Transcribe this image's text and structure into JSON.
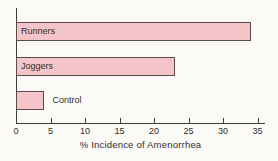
{
  "colors": {
    "background": "#fbfaf6",
    "bar_fill": "#f5c4c8",
    "bar_border": "#584c4d",
    "axis": "#3d3d3d",
    "text": "#2f2f2f"
  },
  "chart_data": {
    "type": "bar",
    "orientation": "horizontal",
    "title": "",
    "categories": [
      "Runners",
      "Joggers",
      "Control"
    ],
    "values": [
      34,
      23,
      4
    ],
    "xlabel": "% Incidence of Amenorrhea",
    "xticks": [
      0,
      5,
      10,
      15,
      20,
      25,
      30,
      35
    ],
    "xlim": [
      0,
      35
    ],
    "grid": false,
    "legend": "none",
    "bar_label_placement": [
      "inside",
      "inside",
      "outside"
    ]
  }
}
